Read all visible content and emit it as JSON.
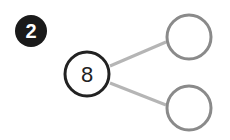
{
  "problem": {
    "number": "2"
  },
  "number_bond": {
    "whole": "8",
    "parts": [
      "",
      ""
    ]
  },
  "colors": {
    "badge": "#1a1a1a",
    "whole_stroke": "#222222",
    "part_stroke": "#8a8a8a",
    "connector": "#b0b0b0"
  }
}
